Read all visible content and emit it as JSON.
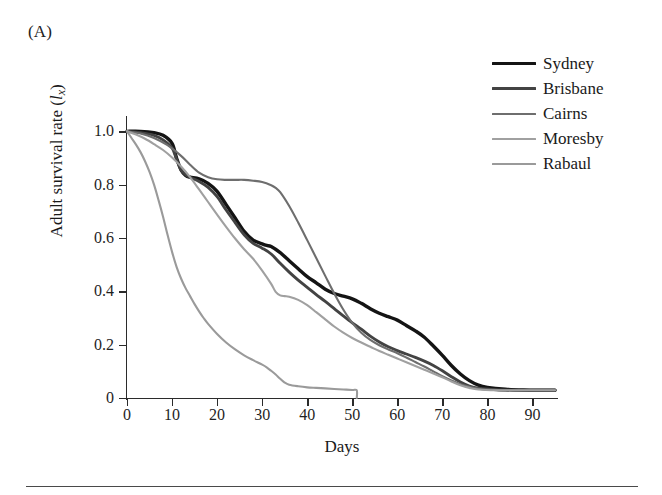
{
  "panel": {
    "label": "(A)"
  },
  "chart_data": {
    "type": "line",
    "title": "",
    "xlabel": "Days",
    "ylabel": "Adult survival rate (lx)",
    "ylabel_main": "Adult survival rate (",
    "ylabel_symbol": "l",
    "ylabel_subscript": "x",
    "ylabel_close": ")",
    "xlim": [
      0,
      95
    ],
    "ylim": [
      0,
      1.05
    ],
    "xticks": [
      0,
      10,
      20,
      30,
      40,
      50,
      60,
      70,
      80,
      90
    ],
    "xtick_labels": [
      "0",
      "10",
      "20",
      "30",
      "40",
      "50",
      "60",
      "70",
      "80",
      "90"
    ],
    "yticks": [
      0,
      0.2,
      0.4,
      0.6,
      0.8,
      1.0
    ],
    "ytick_labels": [
      "0",
      "0.2",
      "0.4",
      "0.6",
      "0.8",
      "1.0"
    ],
    "grid": false,
    "legend_position": "top-right",
    "series": [
      {
        "name": "Sydney",
        "color": "#141414",
        "width": 3.4,
        "x": [
          0,
          3,
          6,
          8,
          10,
          11,
          12,
          13,
          14,
          16,
          18,
          20,
          22,
          24,
          26,
          28,
          30,
          31,
          32,
          34,
          36,
          38,
          40,
          42,
          44,
          46,
          48,
          50,
          52,
          54,
          56,
          58,
          60,
          62,
          64,
          66,
          68,
          70,
          72,
          74,
          76,
          78,
          80,
          84,
          88,
          92,
          95
        ],
        "y": [
          1.0,
          1.0,
          0.995,
          0.985,
          0.955,
          0.9,
          0.855,
          0.835,
          0.828,
          0.822,
          0.805,
          0.775,
          0.725,
          0.675,
          0.625,
          0.592,
          0.578,
          0.572,
          0.568,
          0.545,
          0.515,
          0.485,
          0.455,
          0.432,
          0.408,
          0.392,
          0.382,
          0.372,
          0.355,
          0.335,
          0.318,
          0.305,
          0.292,
          0.272,
          0.252,
          0.228,
          0.195,
          0.16,
          0.122,
          0.09,
          0.065,
          0.048,
          0.04,
          0.033,
          0.03,
          0.029,
          0.029
        ]
      },
      {
        "name": "Brisbane",
        "color": "#434343",
        "width": 2.9,
        "x": [
          0,
          3,
          6,
          8,
          10,
          11,
          12,
          13,
          14,
          16,
          18,
          20,
          22,
          24,
          26,
          28,
          30,
          32,
          34,
          36,
          38,
          40,
          42,
          44,
          46,
          48,
          50,
          52,
          54,
          56,
          58,
          60,
          62,
          64,
          66,
          68,
          70,
          72,
          74,
          76,
          78,
          82,
          86,
          90,
          95
        ],
        "y": [
          1.0,
          0.995,
          0.985,
          0.968,
          0.938,
          0.895,
          0.855,
          0.838,
          0.828,
          0.812,
          0.79,
          0.755,
          0.705,
          0.658,
          0.612,
          0.58,
          0.562,
          0.54,
          0.505,
          0.472,
          0.442,
          0.415,
          0.388,
          0.362,
          0.335,
          0.308,
          0.282,
          0.258,
          0.232,
          0.21,
          0.192,
          0.178,
          0.165,
          0.152,
          0.138,
          0.122,
          0.102,
          0.08,
          0.06,
          0.045,
          0.037,
          0.031,
          0.029,
          0.029,
          0.029
        ]
      },
      {
        "name": "Cairns",
        "color": "#6e6e6e",
        "width": 2.1,
        "x": [
          0,
          3,
          6,
          9,
          12,
          14,
          16,
          18,
          20,
          22,
          24,
          26,
          28,
          30,
          32,
          33,
          34,
          36,
          38,
          40,
          42,
          44,
          46,
          48,
          50,
          52,
          54,
          56,
          58,
          60,
          62,
          64,
          66,
          68,
          70,
          72,
          74,
          76,
          78,
          82,
          86,
          90,
          95
        ],
        "y": [
          1.0,
          0.992,
          0.975,
          0.948,
          0.908,
          0.875,
          0.845,
          0.828,
          0.82,
          0.818,
          0.818,
          0.818,
          0.815,
          0.81,
          0.798,
          0.788,
          0.772,
          0.72,
          0.658,
          0.592,
          0.525,
          0.458,
          0.392,
          0.332,
          0.282,
          0.245,
          0.218,
          0.198,
          0.182,
          0.168,
          0.152,
          0.135,
          0.118,
          0.1,
          0.082,
          0.066,
          0.052,
          0.042,
          0.035,
          0.03,
          0.029,
          0.029,
          0.029
        ]
      },
      {
        "name": "Moresby",
        "color": "#a0a0a0",
        "width": 2.1,
        "x": [
          0,
          2,
          4,
          6,
          8,
          10,
          12,
          14,
          16,
          18,
          20,
          22,
          24,
          26,
          28,
          30,
          32,
          33,
          34,
          35,
          36,
          38,
          40,
          42,
          44,
          46,
          48,
          50,
          52,
          54,
          56,
          58,
          60,
          62,
          64,
          66,
          68,
          70,
          72,
          74,
          76,
          78,
          82,
          86,
          90,
          95
        ],
        "y": [
          1.0,
          0.988,
          0.972,
          0.952,
          0.93,
          0.902,
          0.868,
          0.828,
          0.782,
          0.735,
          0.688,
          0.642,
          0.598,
          0.558,
          0.522,
          0.478,
          0.428,
          0.398,
          0.385,
          0.382,
          0.38,
          0.368,
          0.348,
          0.322,
          0.295,
          0.268,
          0.245,
          0.225,
          0.208,
          0.192,
          0.176,
          0.162,
          0.148,
          0.134,
          0.12,
          0.106,
          0.092,
          0.078,
          0.062,
          0.048,
          0.038,
          0.032,
          0.029,
          0.029,
          0.029,
          0.029
        ]
      },
      {
        "name": "Rabaul",
        "color": "#9a9a9a",
        "width": 2.1,
        "x": [
          0,
          1,
          2,
          3,
          4,
          5,
          6,
          7,
          8,
          9,
          10,
          11,
          12,
          13,
          14,
          15,
          16,
          17,
          18,
          20,
          22,
          24,
          26,
          28,
          30,
          31,
          32,
          33,
          34,
          35,
          36,
          38,
          40,
          42,
          44,
          46,
          48,
          50,
          51,
          51
        ],
        "y": [
          1.0,
          0.975,
          0.95,
          0.922,
          0.888,
          0.848,
          0.8,
          0.742,
          0.68,
          0.612,
          0.548,
          0.492,
          0.448,
          0.412,
          0.382,
          0.352,
          0.325,
          0.3,
          0.278,
          0.24,
          0.208,
          0.182,
          0.16,
          0.142,
          0.125,
          0.115,
          0.102,
          0.088,
          0.072,
          0.058,
          0.05,
          0.044,
          0.04,
          0.038,
          0.036,
          0.034,
          0.032,
          0.03,
          0.029,
          0.0
        ]
      }
    ]
  }
}
